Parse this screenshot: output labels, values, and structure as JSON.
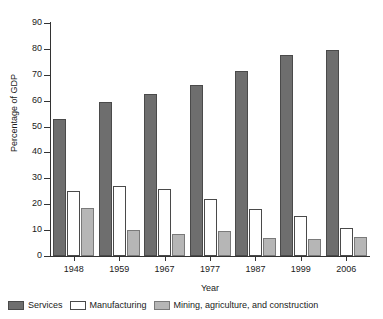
{
  "chart_data": {
    "type": "bar",
    "title": "",
    "xlabel": "Year",
    "ylabel": "Percentage of GDP",
    "categories": [
      "1948",
      "1959",
      "1967",
      "1977",
      "1987",
      "1999",
      "2006"
    ],
    "series": [
      {
        "name": "Services",
        "color": "#6e6e6e",
        "values": [
          53,
          59.5,
          62.5,
          66,
          71.5,
          77.5,
          79.5
        ]
      },
      {
        "name": "Manufacturing",
        "color": "#ffffff",
        "values": [
          25,
          27,
          26,
          22,
          18,
          15.5,
          11
        ]
      },
      {
        "name": "Mining, agriculture, and construction",
        "color": "#b6b6b6",
        "values": [
          18.5,
          10,
          8.5,
          9.5,
          7,
          6.5,
          7.5
        ]
      }
    ],
    "ylim": [
      0,
      90
    ],
    "yticks": [
      0,
      10,
      20,
      30,
      40,
      50,
      60,
      70,
      80,
      90
    ],
    "ytick_labels": [
      "0",
      "10",
      "20",
      "30",
      "40",
      "50",
      "60",
      "70",
      "80",
      "90"
    ],
    "grid": false,
    "legend_position": "bottom"
  },
  "legend": {
    "entries": [
      {
        "label": "Services"
      },
      {
        "label": "Manufacturing"
      },
      {
        "label": "Mining, agriculture, and construction"
      }
    ]
  },
  "axes": {
    "y_title": "Percentage of GDP",
    "x_title": "Year"
  }
}
